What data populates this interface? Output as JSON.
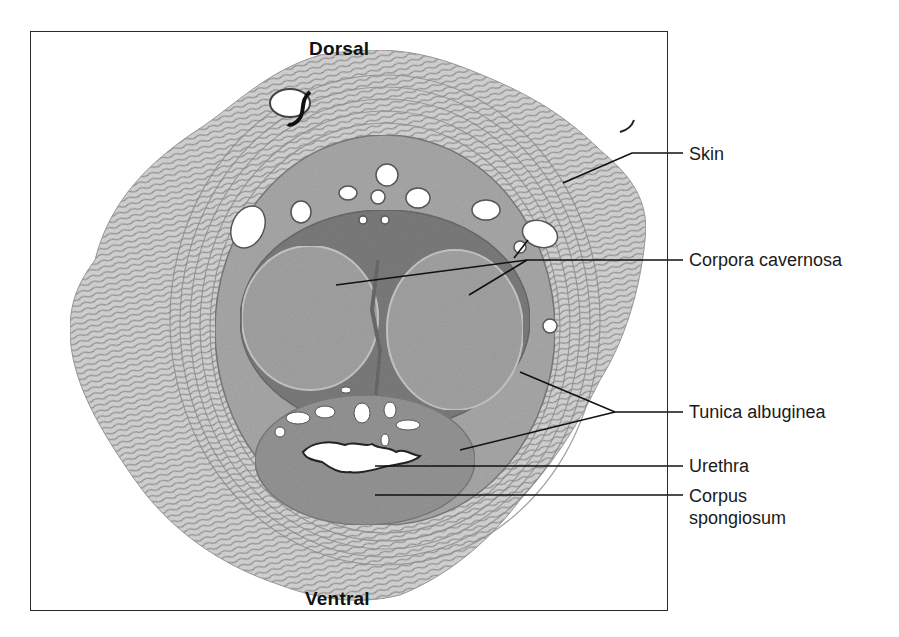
{
  "figure": {
    "type": "histology micrograph",
    "orientation": {
      "top": "Dorsal",
      "bottom": "Ventral"
    },
    "labels": [
      {
        "id": "skin",
        "text": "Skin"
      },
      {
        "id": "corpora_cavernosa",
        "text": "Corpora cavernosa"
      },
      {
        "id": "tunica_albuginea",
        "text": "Tunica albuginea"
      },
      {
        "id": "urethra",
        "text": "Urethra"
      },
      {
        "id": "corpus_spongiosum",
        "text": "Corpus spongiosum"
      }
    ],
    "colors": {
      "tissue_dark": "#6e6e6e",
      "tissue_mid": "#9a9a9a",
      "tissue_light": "#c9c9c9",
      "lumen": "#ffffff",
      "leader_line": "#111111",
      "frame": "#2a2a2a"
    }
  }
}
